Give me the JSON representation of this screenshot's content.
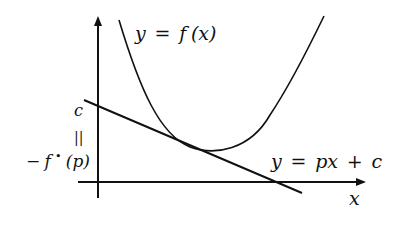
{
  "diagram": {
    "curve_label": {
      "y": "y",
      "eq": "=",
      "f": "f",
      "args": "(x)"
    },
    "line_label": {
      "y": "y",
      "eq": "=",
      "rhs_p": "px",
      "plus": "+",
      "c": "c"
    },
    "x_axis_label": "x",
    "intercept_label": {
      "c": "c",
      "equals_vertical": "||",
      "minus": "−",
      "f": "f",
      "star": "•",
      "arg": "(p)"
    },
    "colors": {
      "stroke": "#111111",
      "background": "#ffffff"
    }
  }
}
